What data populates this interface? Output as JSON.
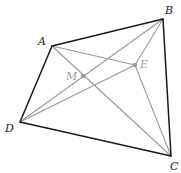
{
  "diagram": {
    "colors": {
      "edge": "#1a1a1a",
      "auxiliary": "#9a9a9a",
      "background": "#ffffff"
    },
    "points": {
      "A": {
        "label": "A",
        "x": 52,
        "y": 46,
        "lx": 38,
        "ly": 45
      },
      "B": {
        "label": "B",
        "x": 163,
        "y": 19,
        "lx": 165,
        "ly": 14
      },
      "C": {
        "label": "C",
        "x": 171,
        "y": 156,
        "lx": 170,
        "ly": 170
      },
      "D": {
        "label": "D",
        "x": 20,
        "y": 122,
        "lx": 5,
        "ly": 132
      },
      "M": {
        "label": "M",
        "x": 83,
        "y": 76,
        "lx": 66,
        "ly": 80
      },
      "E": {
        "label": "E",
        "x": 135,
        "y": 65,
        "lx": 140,
        "ly": 68
      }
    },
    "edges": [
      [
        "A",
        "B"
      ],
      [
        "B",
        "C"
      ],
      [
        "C",
        "D"
      ],
      [
        "D",
        "A"
      ]
    ],
    "auxiliary_lines": [
      [
        "A",
        "C"
      ],
      [
        "B",
        "D"
      ],
      [
        "A",
        "E"
      ],
      [
        "D",
        "E"
      ],
      [
        "B",
        "E"
      ],
      [
        "E",
        "C"
      ]
    ]
  }
}
